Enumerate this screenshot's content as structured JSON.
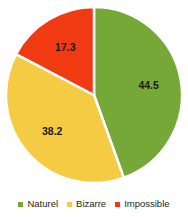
{
  "chart_data": {
    "type": "pie",
    "title": "",
    "xlabel": "",
    "ylabel": "",
    "categories": [
      "Naturel",
      "Bizarre",
      "Impossible"
    ],
    "values": [
      44.5,
      38.2,
      17.3
    ],
    "labels": [
      "44.5",
      "38.2",
      "17.3"
    ],
    "colors": [
      "#76a838",
      "#f5cb43",
      "#f03a12"
    ],
    "units": "percent",
    "total": 100.0,
    "start_angle_deg": 0,
    "direction": "clockwise",
    "grid": false,
    "legend_position": "bottom",
    "slice_separator_color": "#ffffff",
    "background_color": "#ffffff",
    "label_text_color": "#1a1a14",
    "slices": [
      {
        "name": "Naturel",
        "value": 44.5,
        "label": "44.5",
        "color": "#76a838"
      },
      {
        "name": "Bizarre",
        "value": 38.2,
        "label": "38.2",
        "color": "#f5cb43"
      },
      {
        "name": "Impossible",
        "value": 17.3,
        "label": "17.3",
        "color": "#f03a12"
      }
    ]
  },
  "legend": {
    "items": [
      {
        "label": "Naturel",
        "color": "#76a838"
      },
      {
        "label": "Bizarre",
        "color": "#f5cb43"
      },
      {
        "label": "Impossible",
        "color": "#f03a12"
      }
    ]
  }
}
